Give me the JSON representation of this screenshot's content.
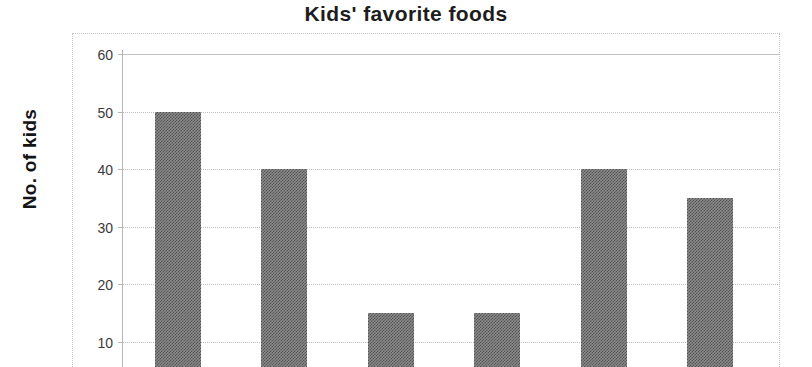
{
  "chart_data": {
    "type": "bar",
    "title": "Kids' favorite foods",
    "xlabel": "",
    "ylabel": "No. of kids",
    "categories": [
      "",
      "",
      "",
      "",
      "",
      ""
    ],
    "values": [
      50,
      40,
      15,
      15,
      40,
      35
    ],
    "ylim": [
      0,
      60
    ],
    "yticks": [
      10,
      20,
      30,
      40,
      50,
      60
    ],
    "ytick_labels": [
      "10",
      "20",
      "30",
      "40",
      "50",
      "60"
    ],
    "grid": true,
    "legend": false,
    "note": "x-axis category labels are cut off below the bottom edge of the screenshot",
    "bar_color": "#7d7d7d",
    "gridline_color": "#bdbdbd",
    "axis_color": "#b6b6b6",
    "background": "#ffffff"
  },
  "axis": {
    "y_title": "No. of kids"
  },
  "header": {
    "title": "Kids' favorite foods"
  }
}
